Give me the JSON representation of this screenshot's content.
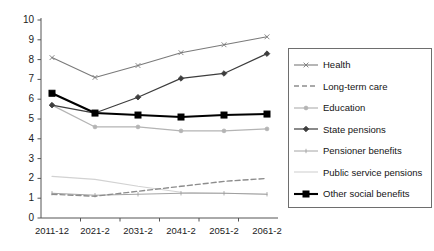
{
  "chart_data": {
    "type": "line",
    "title": "",
    "subtitle": "",
    "xlabel": "",
    "ylabel": "",
    "grid": false,
    "legend_position": "right",
    "categories": [
      "2011-12",
      "2021-2",
      "2031-2",
      "2041-2",
      "2051-2",
      "2061-2"
    ],
    "ylim": [
      0,
      10
    ],
    "yticks": [
      0,
      1,
      2,
      3,
      4,
      5,
      6,
      7,
      8,
      9,
      10
    ],
    "ytick_labels": [
      "0",
      "1",
      "2",
      "3",
      "4",
      "5",
      "6",
      "7",
      "8",
      "9",
      "10"
    ],
    "series": [
      {
        "name": "Health",
        "color": "#7a7a7a",
        "dash": "none",
        "marker": "x",
        "width": 1.1,
        "values": [
          8.1,
          7.1,
          7.7,
          8.35,
          8.75,
          9.15
        ]
      },
      {
        "name": "Long-term care",
        "color": "#8d8d8d",
        "dash": "dashed",
        "marker": "none",
        "width": 1.4,
        "values": [
          1.2,
          1.1,
          1.35,
          1.6,
          1.85,
          2.0
        ]
      },
      {
        "name": "Education",
        "color": "#b4b4b4",
        "dash": "none",
        "marker": "dot",
        "width": 1.2,
        "values": [
          5.7,
          4.6,
          4.6,
          4.4,
          4.4,
          4.5
        ]
      },
      {
        "name": "State pensions",
        "color": "#3d3d3d",
        "dash": "none",
        "marker": "diamond",
        "width": 1.2,
        "values": [
          5.7,
          5.3,
          6.1,
          7.05,
          7.3,
          8.3
        ]
      },
      {
        "name": "Pensioner benefits",
        "color": "#9a9a9a",
        "dash": "none",
        "marker": "tick",
        "width": 0.9,
        "values": [
          1.25,
          1.15,
          1.2,
          1.25,
          1.25,
          1.2
        ]
      },
      {
        "name": "Public service pensions",
        "color": "#d2d2d2",
        "dash": "none",
        "marker": "none",
        "width": 1.1,
        "values": [
          2.1,
          1.95,
          1.6,
          1.3,
          1.25,
          1.2
        ]
      },
      {
        "name": "Other social benefits",
        "color": "#000000",
        "dash": "none",
        "marker": "square",
        "width": 2.1,
        "values": [
          6.3,
          5.3,
          5.2,
          5.1,
          5.2,
          5.25
        ]
      }
    ]
  },
  "axes": {
    "y_axis_color": "#555555",
    "x_axis_color": "#555555"
  },
  "legend": {
    "items": [
      {
        "label": "Health"
      },
      {
        "label": "Long-term care"
      },
      {
        "label": "Education"
      },
      {
        "label": "State pensions"
      },
      {
        "label": "Pensioner benefits"
      },
      {
        "label": "Public service pensions"
      },
      {
        "label": "Other social benefits"
      }
    ]
  }
}
